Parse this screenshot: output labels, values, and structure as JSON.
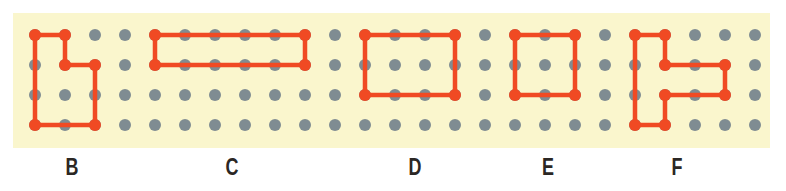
{
  "figure": {
    "name": "geoboard-shapes-figure",
    "panel": {
      "background_color": "#faf6cd",
      "x": 13,
      "y": 13,
      "width": 757,
      "height": 135
    },
    "page_background_color": "#ffffff"
  },
  "grid": {
    "columns": 25,
    "rows": 4,
    "origin_x": 35,
    "origin_y": 35,
    "spacing": 30,
    "peg_color": "#7f8c92",
    "peg_radius": 6,
    "vertex_color": "#f04a23",
    "vertex_radius": 6,
    "line_color": "#f04a23",
    "line_width": 4.5
  },
  "shapes": [
    {
      "id": "shape-b",
      "label": "B",
      "label_x": 72,
      "label_y": 156,
      "closed": true,
      "points": [
        [
          0,
          0
        ],
        [
          1,
          0
        ],
        [
          1,
          1
        ],
        [
          2,
          1
        ],
        [
          2,
          3
        ],
        [
          0,
          3
        ]
      ]
    },
    {
      "id": "shape-c",
      "label": "C",
      "label_x": 232,
      "label_y": 156,
      "closed": true,
      "points": [
        [
          4,
          0
        ],
        [
          9,
          0
        ],
        [
          9,
          1
        ],
        [
          4,
          1
        ]
      ]
    },
    {
      "id": "shape-d",
      "label": "D",
      "label_x": 415,
      "label_y": 156,
      "closed": true,
      "points": [
        [
          11,
          0
        ],
        [
          14,
          0
        ],
        [
          14,
          2
        ],
        [
          11,
          2
        ]
      ]
    },
    {
      "id": "shape-e",
      "label": "E",
      "label_x": 548,
      "label_y": 156,
      "closed": true,
      "points": [
        [
          16,
          0
        ],
        [
          18,
          0
        ],
        [
          18,
          2
        ],
        [
          16,
          2
        ]
      ]
    },
    {
      "id": "shape-f",
      "label": "F",
      "label_x": 677,
      "label_y": 156,
      "closed": true,
      "points": [
        [
          20,
          0
        ],
        [
          21,
          0
        ],
        [
          21,
          1
        ],
        [
          23,
          1
        ],
        [
          23,
          2
        ],
        [
          21,
          2
        ],
        [
          21,
          3
        ],
        [
          20,
          3
        ]
      ]
    }
  ],
  "labels": {
    "text": [
      "B",
      "C",
      "D",
      "E",
      "F"
    ]
  }
}
